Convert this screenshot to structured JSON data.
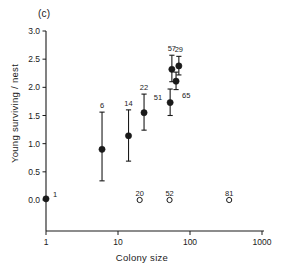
{
  "figure": {
    "panel_label": "(c)"
  },
  "chart_data": {
    "type": "scatter",
    "title": "(c)",
    "xlabel": "Colony size",
    "ylabel": "Young surviving / nest",
    "xscale": "log",
    "xlim": [
      1,
      1000
    ],
    "ylim": [
      0.0,
      3.0
    ],
    "grid": false,
    "legend": null,
    "xticks": [
      1,
      10,
      100,
      1000
    ],
    "xtick_labels": [
      "1",
      "10",
      "100",
      "1000"
    ],
    "yticks": [
      0.0,
      0.5,
      1.0,
      1.5,
      2.0,
      2.5,
      3.0
    ],
    "ytick_labels": [
      "0.0",
      "0.5",
      "1.0",
      "1.5",
      "2.0",
      "2.5",
      "3.0"
    ],
    "series": [
      {
        "name": "mean with error bars (filled circles)",
        "marker": "filled-circle",
        "points": [
          {
            "x": 1,
            "y": 0.02,
            "yerr_low": 0.02,
            "yerr_high": 0.02,
            "label": "1",
            "label_pos": "right"
          },
          {
            "x": 6,
            "y": 0.9,
            "yerr_low": 0.34,
            "yerr_high": 1.56,
            "label": "6",
            "label_pos": "top"
          },
          {
            "x": 14,
            "y": 1.14,
            "yerr_low": 0.69,
            "yerr_high": 1.6,
            "label": "14",
            "label_pos": "top"
          },
          {
            "x": 23,
            "y": 1.55,
            "yerr_low": 1.24,
            "yerr_high": 1.88,
            "label": "22",
            "label_pos": "top"
          },
          {
            "x": 53,
            "y": 1.73,
            "yerr_low": 1.5,
            "yerr_high": 1.97,
            "label": "51",
            "label_pos": "topleft"
          },
          {
            "x": 56,
            "y": 2.32,
            "yerr_low": 2.1,
            "yerr_high": 2.57,
            "label": "57",
            "label_pos": "top"
          },
          {
            "x": 64,
            "y": 2.11,
            "yerr_low": 1.96,
            "yerr_high": 2.27,
            "label": "65",
            "label_pos": "bottomright"
          },
          {
            "x": 70,
            "y": 2.38,
            "yerr_low": 2.22,
            "yerr_high": 2.55,
            "label": "29",
            "label_pos": "top"
          }
        ]
      },
      {
        "name": "zero values (open circles)",
        "marker": "open-circle",
        "points": [
          {
            "x": 20,
            "y": 0.0,
            "label": "20",
            "label_pos": "top"
          },
          {
            "x": 52,
            "y": 0.0,
            "label": "52",
            "label_pos": "top"
          },
          {
            "x": 350,
            "y": 0.0,
            "label": "81",
            "label_pos": "top"
          }
        ]
      }
    ]
  }
}
